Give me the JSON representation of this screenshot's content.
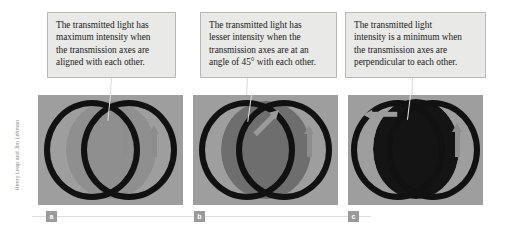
{
  "figure": {
    "credit": "Henry Leap and Jim Lehman",
    "background_color": "#ffffff",
    "callout_fill": "#e9e9e7",
    "callout_border": "#b8b8b4",
    "photo_background": "#9e9e9e",
    "ring_color": "#111111",
    "arrow_color": "#8d8d8d",
    "label_badge_color": "#9a9a9a",
    "rule_color": "#dedede"
  },
  "panels": [
    {
      "id": "a",
      "label": "a",
      "caption_lines": [
        "The transmitted light has",
        "maximum intensity when",
        "the transmission axes are",
        "aligned with each other."
      ],
      "caption_text": "The transmitted light has maximum intensity when the transmission axes are aligned with each other.",
      "overlap_shade": "#8f8f8f",
      "axis_angle_deg": 0,
      "relative_intensity": "maximum",
      "arrow_left_angle_deg": 0,
      "arrow_right_angle_deg": 0
    },
    {
      "id": "b",
      "label": "b",
      "caption_lines": [
        "The transmitted light has",
        "lesser intensity when the",
        "transmission axes are at an",
        "angle of 45° with each other."
      ],
      "caption_text": "The transmitted light has lesser intensity when the transmission axes are at an angle of 45° with each other.",
      "overlap_shade": "#6e6e6e",
      "axis_angle_deg": 45,
      "relative_intensity": "lesser",
      "arrow_left_angle_deg": 45,
      "arrow_right_angle_deg": 0
    },
    {
      "id": "c",
      "label": "c",
      "caption_lines": [
        "The transmitted light",
        "intensity is a minimum when",
        "the transmission axes are",
        "perpendicular to each other."
      ],
      "caption_text": "The transmitted light intensity is a minimum when the transmission axes are perpendicular to each other.",
      "overlap_shade": "#141414",
      "axis_angle_deg": 90,
      "relative_intensity": "minimum",
      "arrow_left_angle_deg": 90,
      "arrow_right_angle_deg": 0
    }
  ]
}
